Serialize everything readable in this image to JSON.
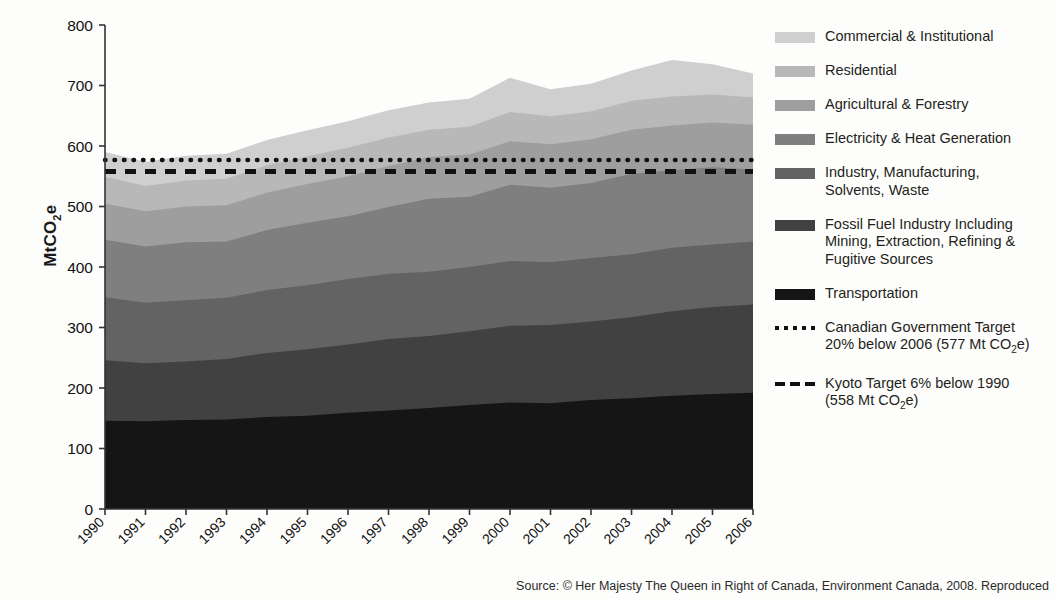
{
  "figure": {
    "ylabel": "MtCO",
    "ylabel_sub": "2",
    "ylabel_tail": "e",
    "source": "Source: © Her Majesty The Queen in Right of Canada, Environment Canada, 2008. Reproduced"
  },
  "legend": {
    "items": [
      {
        "label": "Commercial & Institutional",
        "color": "#cfcfcf",
        "marker": "swatch"
      },
      {
        "label": "Residential",
        "color": "#b8b8b8",
        "marker": "swatch"
      },
      {
        "label": "Agricultural & Forestry",
        "color": "#9e9e9e",
        "marker": "swatch"
      },
      {
        "label": "Electricity & Heat Generation",
        "color": "#7f7f7f",
        "marker": "swatch"
      },
      {
        "label": "Industry, Manufacturing,\nSolvents, Waste",
        "color": "#636363",
        "marker": "swatch"
      },
      {
        "label": "Fossil Fuel Industry Including\nMining, Extraction, Refining &\nFugitive Sources",
        "color": "#414141",
        "marker": "swatch"
      },
      {
        "label": "Transportation",
        "color": "#151515",
        "marker": "swatch"
      },
      {
        "label": "Canadian Government Target\n20% below 2006 (577 Mt CO₂e)",
        "color": "#111111",
        "marker": "dotted"
      },
      {
        "label": "Kyoto Target 6% below 1990\n(558 Mt CO₂e)",
        "color": "#111111",
        "marker": "dashed"
      }
    ]
  },
  "chart_data": {
    "type": "area",
    "title": "",
    "xlabel": "",
    "ylabel": "MtCO2e",
    "ylim": [
      0,
      800
    ],
    "yticks": [
      0,
      100,
      200,
      300,
      400,
      500,
      600,
      700,
      800
    ],
    "grid": false,
    "legend_position": "right",
    "categories": [
      "1990",
      "1991",
      "1992",
      "1993",
      "1994",
      "1995",
      "1996",
      "1997",
      "1998",
      "1999",
      "2000",
      "2001",
      "2002",
      "2003",
      "2004",
      "2005",
      "2006"
    ],
    "stack_order_bottom_to_top": [
      "Transportation",
      "Fossil Fuel Industry Including Mining, Extraction, Refining & Fugitive Sources",
      "Industry, Manufacturing, Solvents, Waste",
      "Electricity & Heat Generation",
      "Agricultural & Forestry",
      "Residential",
      "Commercial & Institutional"
    ],
    "series": [
      {
        "name": "Transportation",
        "color": "#151515",
        "values": [
          146,
          145,
          147,
          148,
          152,
          154,
          159,
          163,
          167,
          172,
          176,
          175,
          180,
          183,
          187,
          190,
          192
        ]
      },
      {
        "name": "Fossil Fuel Industry Including Mining, Extraction, Refining & Fugitive Sources",
        "color": "#414141",
        "values": [
          100,
          96,
          97,
          100,
          106,
          110,
          113,
          118,
          119,
          122,
          127,
          129,
          130,
          134,
          140,
          144,
          146
        ]
      },
      {
        "name": "Industry, Manufacturing, Solvents, Waste",
        "color": "#636363",
        "values": [
          104,
          100,
          101,
          101,
          104,
          106,
          108,
          108,
          106,
          106,
          107,
          104,
          105,
          104,
          105,
          103,
          104
        ]
      },
      {
        "name": "Electricity & Heat Generation",
        "color": "#7f7f7f",
        "values": [
          95,
          93,
          96,
          93,
          99,
          103,
          104,
          110,
          121,
          116,
          126,
          123,
          124,
          133,
          128,
          128,
          119
        ]
      },
      {
        "name": "Agricultural & Forestry",
        "color": "#9e9e9e",
        "values": [
          60,
          58,
          59,
          60,
          62,
          64,
          66,
          68,
          69,
          70,
          72,
          72,
          72,
          73,
          74,
          74,
          74
        ]
      },
      {
        "name": "Residential",
        "color": "#b8b8b8",
        "values": [
          44,
          42,
          43,
          44,
          45,
          46,
          47,
          47,
          45,
          46,
          48,
          46,
          46,
          48,
          48,
          46,
          45
        ]
      },
      {
        "name": "Commercial & Institutional",
        "color": "#cfcfcf",
        "values": [
          41,
          40,
          41,
          41,
          42,
          43,
          44,
          45,
          45,
          46,
          57,
          45,
          46,
          50,
          60,
          50,
          40
        ]
      }
    ],
    "totals": [
      590,
      574,
      584,
      587,
      610,
      626,
      641,
      659,
      672,
      678,
      713,
      694,
      703,
      725,
      742,
      735,
      720
    ],
    "reference_lines": [
      {
        "name": "Canadian Government Target 20% below 2006",
        "value": 577,
        "style": "dotted"
      },
      {
        "name": "Kyoto Target 6% below 1990",
        "value": 558,
        "style": "dashed"
      }
    ]
  }
}
